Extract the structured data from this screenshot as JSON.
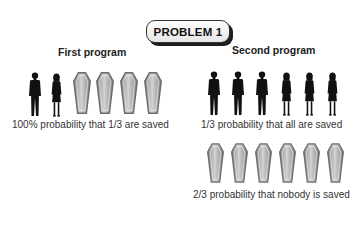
{
  "title": "PROBLEM 1",
  "first_program": {
    "heading": "First program",
    "people": [
      "man",
      "woman"
    ],
    "coffins": 4,
    "caption": "100% probability that 1/3 are saved"
  },
  "second_program": {
    "heading": "Second program",
    "people": [
      "man",
      "man",
      "man",
      "woman",
      "woman",
      "woman"
    ],
    "people_caption": "1/3 probability that all are saved",
    "coffins": 6,
    "coffins_caption": "2/3 probability that nobody is saved"
  },
  "colors": {
    "silhouette": "#111111",
    "coffin_fill": "#a8a8a8",
    "coffin_edge": "#6a6a6a",
    "badge_shadow": "#1e1e1e"
  }
}
